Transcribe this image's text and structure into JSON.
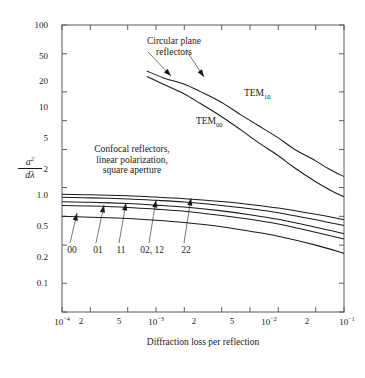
{
  "chart_data": {
    "type": "line",
    "title": "",
    "xlabel": "Diffraction loss per reflection",
    "ylabel": "a^2 / dλ",
    "ylabel_numerator": "a",
    "ylabel_numerator_exp": "2",
    "ylabel_denominator": "dλ",
    "xscale": "log",
    "yscale": "log",
    "xlim": [
      0.0001,
      0.1
    ],
    "ylim": [
      0.1,
      100
    ],
    "grid": false,
    "legend_position": "inline-annotations",
    "xtick_labels": [
      {
        "value": 0.0001,
        "label": "10⁻⁴",
        "base": "10",
        "exp": "-4"
      },
      {
        "value": 0.0002,
        "label": "2",
        "base": "2",
        "exp": ""
      },
      {
        "value": 0.0005,
        "label": "5",
        "base": "5",
        "exp": ""
      },
      {
        "value": 0.001,
        "label": "10⁻³",
        "base": "10",
        "exp": "-3"
      },
      {
        "value": 0.002,
        "label": "2",
        "base": "2",
        "exp": ""
      },
      {
        "value": 0.005,
        "label": "5",
        "base": "5",
        "exp": ""
      },
      {
        "value": 0.01,
        "label": "10⁻²",
        "base": "10",
        "exp": "-2"
      },
      {
        "value": 0.02,
        "label": "2",
        "base": "2",
        "exp": ""
      },
      {
        "value": 0.05,
        "label": "5",
        "base": "5",
        "exp": ""
      },
      {
        "value": 0.1,
        "label": "10⁻¹",
        "base": "10",
        "exp": "-1"
      }
    ],
    "ytick_labels": [
      {
        "value": 100,
        "label": "100"
      },
      {
        "value": 50,
        "label": "50"
      },
      {
        "value": 20,
        "label": "20"
      },
      {
        "value": 10,
        "label": "10"
      },
      {
        "value": 5,
        "label": "5"
      },
      {
        "value": 2,
        "label": "2"
      },
      {
        "value": 1.0,
        "label": "1.0"
      },
      {
        "value": 0.5,
        "label": "0.5"
      },
      {
        "value": 0.2,
        "label": "0.2"
      },
      {
        "value": 0.1,
        "label": "0.1"
      }
    ],
    "annotations": [
      {
        "name": "circular-plane-reflectors",
        "lines": [
          "Circular plane",
          "reflectors"
        ]
      },
      {
        "name": "confocal-note",
        "lines": [
          "Confocal reflectors,",
          "linear polarization,",
          "square aperture"
        ]
      }
    ],
    "series": [
      {
        "name": "TEM10",
        "label": "TEM",
        "label_sub": "10",
        "group": "circular plane reflectors",
        "points": [
          [
            0.0008,
            33.0
          ],
          [
            0.0012,
            28.0
          ],
          [
            0.002,
            24.0
          ],
          [
            0.003,
            20.0
          ],
          [
            0.005,
            15.5
          ],
          [
            0.008,
            11.5
          ],
          [
            0.012,
            9.0
          ],
          [
            0.02,
            6.6
          ],
          [
            0.03,
            5.0
          ],
          [
            0.05,
            3.8
          ],
          [
            0.07,
            3.1
          ],
          [
            0.1,
            2.6
          ]
        ]
      },
      {
        "name": "TEM00",
        "label": "TEM",
        "label_sub": "00",
        "group": "circular plane reflectors",
        "points": [
          [
            0.0008,
            29.0
          ],
          [
            0.0012,
            24.0
          ],
          [
            0.002,
            19.0
          ],
          [
            0.003,
            15.0
          ],
          [
            0.005,
            11.0
          ],
          [
            0.008,
            8.0
          ],
          [
            0.012,
            6.0
          ],
          [
            0.02,
            4.3
          ],
          [
            0.03,
            3.2
          ],
          [
            0.05,
            2.3
          ],
          [
            0.07,
            1.9
          ],
          [
            0.1,
            1.6
          ]
        ]
      },
      {
        "name": "mode-00",
        "label": "00",
        "group": "confocal square aperture",
        "points": [
          [
            0.0001,
            1.0
          ],
          [
            0.0002,
            0.98
          ],
          [
            0.0005,
            0.95
          ],
          [
            0.001,
            0.91
          ],
          [
            0.002,
            0.86
          ],
          [
            0.005,
            0.78
          ],
          [
            0.01,
            0.7
          ],
          [
            0.02,
            0.62
          ],
          [
            0.05,
            0.5
          ],
          [
            0.1,
            0.41
          ]
        ]
      },
      {
        "name": "mode-01",
        "label": "01",
        "group": "confocal square aperture",
        "points": [
          [
            0.0001,
            1.3
          ],
          [
            0.0002,
            1.28
          ],
          [
            0.0005,
            1.24
          ],
          [
            0.001,
            1.19
          ],
          [
            0.002,
            1.13
          ],
          [
            0.005,
            1.02
          ],
          [
            0.01,
            0.93
          ],
          [
            0.02,
            0.83
          ],
          [
            0.05,
            0.68
          ],
          [
            0.1,
            0.58
          ]
        ]
      },
      {
        "name": "mode-11",
        "label": "11",
        "group": "confocal square aperture",
        "points": [
          [
            0.0001,
            1.42
          ],
          [
            0.0002,
            1.4
          ],
          [
            0.0005,
            1.36
          ],
          [
            0.001,
            1.31
          ],
          [
            0.002,
            1.25
          ],
          [
            0.005,
            1.14
          ],
          [
            0.01,
            1.04
          ],
          [
            0.02,
            0.93
          ],
          [
            0.05,
            0.77
          ],
          [
            0.1,
            0.66
          ]
        ]
      },
      {
        "name": "mode-02-12",
        "label": "02, 12",
        "group": "confocal square aperture",
        "points": [
          [
            0.0001,
            1.58
          ],
          [
            0.0002,
            1.56
          ],
          [
            0.0005,
            1.52
          ],
          [
            0.001,
            1.47
          ],
          [
            0.002,
            1.41
          ],
          [
            0.005,
            1.3
          ],
          [
            0.01,
            1.2
          ],
          [
            0.02,
            1.09
          ],
          [
            0.05,
            0.92
          ],
          [
            0.1,
            0.8
          ]
        ]
      },
      {
        "name": "mode-22",
        "label": "22",
        "group": "confocal square aperture",
        "points": [
          [
            0.0001,
            1.7
          ],
          [
            0.0002,
            1.68
          ],
          [
            0.0005,
            1.64
          ],
          [
            0.001,
            1.59
          ],
          [
            0.002,
            1.53
          ],
          [
            0.005,
            1.43
          ],
          [
            0.01,
            1.33
          ],
          [
            0.02,
            1.22
          ],
          [
            0.05,
            1.05
          ],
          [
            0.1,
            0.92
          ]
        ]
      }
    ],
    "mode_pointer_labels": [
      "00",
      "01",
      "11",
      "02, 12",
      "22"
    ],
    "colors": {
      "curve": "#1a1a1a",
      "axis": "#555555",
      "background": "#ffffff",
      "text": "#1a1a1a"
    }
  },
  "axis": {
    "x_title": "Diffraction loss per reflection"
  },
  "curve_labels": {
    "tem10_base": "TEM",
    "tem10_sub": "10",
    "tem00_base": "TEM",
    "tem00_sub": "00"
  },
  "notes": {
    "circular_line1": "Circular plane",
    "circular_line2": "reflectors",
    "confocal_line1": "Confocal reflectors,",
    "confocal_line2": "linear polarization,",
    "confocal_line3": "square aperture"
  },
  "mode_labels": {
    "m00": "00",
    "m01": "01",
    "m11": "11",
    "m0212": "02, 12",
    "m22": "22"
  },
  "ylabel": {
    "numerator": "a",
    "numerator_exp": "2",
    "denominator": "dλ"
  }
}
